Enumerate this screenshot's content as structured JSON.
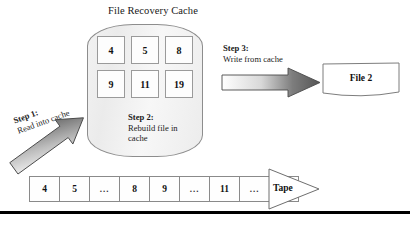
{
  "diagram": {
    "title": "File Recovery Cache",
    "cache": {
      "label": "File Recovery Cache",
      "blocks": [
        "4",
        "5",
        "8",
        "9",
        "11",
        "19"
      ]
    },
    "steps": [
      {
        "id": "step1",
        "title": "Step 1:",
        "body": "Read into cache"
      },
      {
        "id": "step2",
        "title": "Step 2:",
        "body_line1": "Rebuild file in",
        "body_line2": "cache"
      },
      {
        "id": "step3",
        "title": "Step 3:",
        "body": "Write from cache"
      }
    ],
    "output_file": {
      "label": "File 2"
    },
    "tape": {
      "head_label": "Tape",
      "cells": [
        "4",
        "5",
        "...",
        "8",
        "9",
        "...",
        "11",
        "...",
        "19"
      ]
    },
    "colors": {
      "arrow_dark": "#595959",
      "arrow_light": "#ffffff",
      "cache_fill": "#efefef",
      "outline": "#8d8d8d",
      "rule": "#000000"
    }
  }
}
